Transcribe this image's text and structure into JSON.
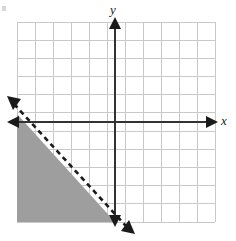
{
  "figure": {
    "type": "coordinate-plane-graph",
    "width": 236,
    "height": 241,
    "background_color": "#ffffff"
  },
  "axes": {
    "x_label": "x",
    "y_label": "y",
    "x_axis_color": "#333333",
    "y_axis_color": "#333333",
    "origin_px": {
      "x": 115,
      "y": 122
    },
    "x_axis_arrow_left": true,
    "x_axis_arrow_right": true,
    "y_axis_arrow_up": true,
    "y_axis_arrow_down": true
  },
  "grid": {
    "color": "#c9c9c9",
    "cell_size_px": 18,
    "columns": 11,
    "rows": 11,
    "left_px": 17,
    "top_px": 22,
    "right_px": 215,
    "bottom_px": 222,
    "visible": true
  },
  "chart_data": {
    "type": "line",
    "title": "",
    "xlabel": "x",
    "ylabel": "y",
    "xlim": [
      -5.44,
      5.56
    ],
    "ylim": [
      -5.56,
      5.56
    ],
    "grid": true,
    "legend": null,
    "boundary_line": {
      "style": "dashed",
      "color": "#1a1a1a",
      "slope": -1.1,
      "y_intercept": -1.0,
      "point_a": {
        "x": -5.44,
        "y": 5.0
      },
      "point_b": {
        "x": 0.0,
        "y": -5.56
      },
      "arrows_both_ends": true,
      "pixel_start": {
        "x": 12,
        "y": 101
      },
      "pixel_end": {
        "x": 130,
        "y": 230
      }
    },
    "shaded_region": {
      "description": "region below the dashed line and below the x-axis in the third quadrant",
      "fill_color": "#9e9e9e",
      "fill_opacity": 1,
      "vertices_px": [
        {
          "x": 17,
          "y": 114
        },
        {
          "x": 17,
          "y": 222
        },
        {
          "x": 115,
          "y": 222
        }
      ]
    }
  },
  "icons": {
    "arrow_left": "arrow-left-icon",
    "arrow_right": "arrow-right-icon",
    "arrow_up": "arrow-up-icon",
    "arrow_down": "arrow-down-icon"
  }
}
